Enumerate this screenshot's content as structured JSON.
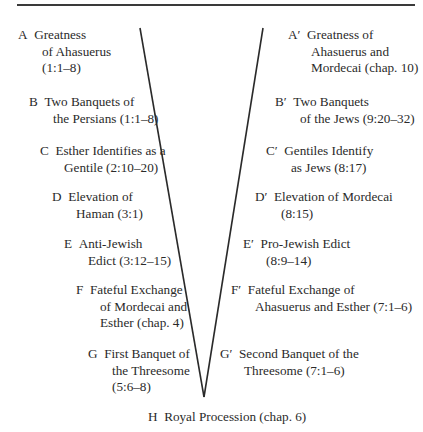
{
  "diagram": {
    "type": "chiasm",
    "line_color": "#2a2a2a",
    "text_color": "#2a2a2a",
    "left": [
      {
        "letter": "A",
        "line1": "Greatness",
        "line2": "of Ahasuerus",
        "line3": "(1:1–8)"
      },
      {
        "letter": "B",
        "line1": "Two Banquets of",
        "line2": "the Persians (1:1–8)"
      },
      {
        "letter": "C",
        "line1": "Esther Identifies as a",
        "line2": "Gentile (2:10–20)"
      },
      {
        "letter": "D",
        "line1": "Elevation of",
        "line2": "Haman (3:1)"
      },
      {
        "letter": "E",
        "line1": "Anti-Jewish",
        "line2": "Edict (3:12–15)"
      },
      {
        "letter": "F",
        "line1": "Fateful Exchange",
        "line2": "of Mordecai and",
        "line3": "Esther (chap. 4)"
      },
      {
        "letter": "G",
        "line1": "First Banquet of",
        "line2": "the Threesome",
        "line3": "(5:6–8)"
      }
    ],
    "right": [
      {
        "letter": "A′",
        "line1": "Greatness of",
        "line2": "Ahasuerus and",
        "line3": "Mordecai (chap. 10)"
      },
      {
        "letter": "B′",
        "line1": "Two Banquets",
        "line2": "of the Jews (9:20–32)"
      },
      {
        "letter": "C′",
        "line1": "Gentiles Identify",
        "line2": "as Jews (8:17)"
      },
      {
        "letter": "D′",
        "line1": "Elevation of Mordecai",
        "line2": "(8:15)"
      },
      {
        "letter": "E′",
        "line1": "Pro-Jewish Edict",
        "line2": "(8:9–14)"
      },
      {
        "letter": "F′",
        "line1": "Fateful Exchange of",
        "line2": "Ahasuerus and Esther (7:1–6)"
      },
      {
        "letter": "G′",
        "line1": "Second Banquet of the",
        "line2": "Threesome (7:1–6)"
      }
    ],
    "center": {
      "letter": "H",
      "text": "Royal Procession (chap. 6)"
    }
  }
}
